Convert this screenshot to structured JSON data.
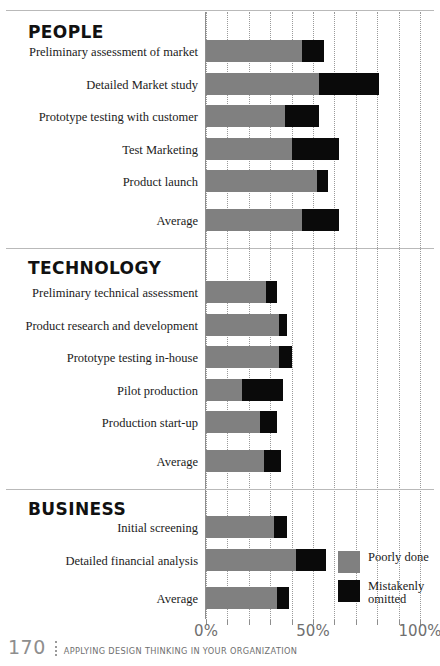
{
  "chart_data": {
    "type": "bar",
    "orientation": "horizontal",
    "stacked": true,
    "title": "",
    "xlabel": "",
    "ylabel": "",
    "xlim": [
      0,
      100
    ],
    "xticks": [
      0,
      10,
      20,
      30,
      40,
      50,
      60,
      70,
      80,
      90,
      100
    ],
    "xtick_labels_shown": [
      "0%",
      "50%",
      "100%"
    ],
    "grid": "vertical dotted every 10%",
    "legend_position": "bottom-right",
    "series": [
      {
        "name": "Poorly done",
        "color": "#808080"
      },
      {
        "name": "Mistakenly omitted",
        "color": "#0a0a0a"
      }
    ],
    "sections": [
      {
        "name": "PEOPLE",
        "rows": [
          {
            "label": "Preliminary assessment of market",
            "poorly_done": 45,
            "mistakenly_omitted": 10
          },
          {
            "label": "Detailed Market study",
            "poorly_done": 53,
            "mistakenly_omitted": 28
          },
          {
            "label": "Prototype testing with customer",
            "poorly_done": 37,
            "mistakenly_omitted": 16
          },
          {
            "label": "Test Marketing",
            "poorly_done": 40,
            "mistakenly_omitted": 22
          },
          {
            "label": "Product launch",
            "poorly_done": 52,
            "mistakenly_omitted": 5
          },
          {
            "label": "Average",
            "poorly_done": 45,
            "mistakenly_omitted": 17
          }
        ]
      },
      {
        "name": "TECHNOLOGY",
        "rows": [
          {
            "label": "Preliminary technical assessment",
            "poorly_done": 28,
            "mistakenly_omitted": 5
          },
          {
            "label": "Product research and development",
            "poorly_done": 34,
            "mistakenly_omitted": 4
          },
          {
            "label": "Prototype testing in-house",
            "poorly_done": 34,
            "mistakenly_omitted": 6
          },
          {
            "label": "Pilot production",
            "poorly_done": 17,
            "mistakenly_omitted": 19
          },
          {
            "label": "Production start-up",
            "poorly_done": 25,
            "mistakenly_omitted": 8
          },
          {
            "label": "Average",
            "poorly_done": 27,
            "mistakenly_omitted": 8
          }
        ]
      },
      {
        "name": "BUSINESS",
        "rows": [
          {
            "label": "Initial screening",
            "poorly_done": 32,
            "mistakenly_omitted": 6
          },
          {
            "label": "Detailed financial analysis",
            "poorly_done": 42,
            "mistakenly_omitted": 14
          },
          {
            "label": "Average",
            "poorly_done": 33,
            "mistakenly_omitted": 6
          }
        ]
      }
    ]
  },
  "legend": {
    "items": [
      {
        "label": "Poorly done",
        "swatch": "gray"
      },
      {
        "label": "Mistakenly omitted",
        "swatch": "black"
      }
    ]
  },
  "footer": {
    "page_number": "170",
    "running_head": "APPLYING DESIGN THINKING IN YOUR ORGANIZATION"
  }
}
